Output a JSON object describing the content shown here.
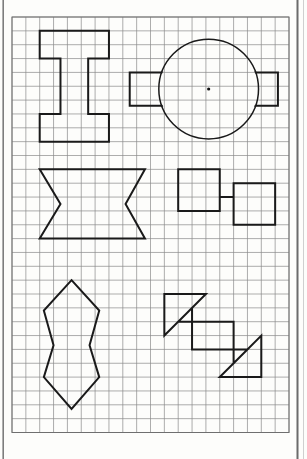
{
  "document": {
    "kind": "graph-paper-worksheet",
    "background_color": "#fdfdfb",
    "page_edge_color": "#6b6b6b",
    "caption": ""
  },
  "grid": {
    "label": "square grid",
    "origin_x": 12,
    "origin_y": 17,
    "cell_size": 13.85,
    "columns": 20,
    "rows": 30,
    "line_color": "#8a8a8a",
    "line_width": 0.7,
    "border_color": "#6f6f6f",
    "border_width": 1.0
  },
  "style": {
    "shape_stroke": "#1a1a1a",
    "shape_stroke_width": 2.0,
    "dot_color": "#111111",
    "dot_radius": 1.6
  },
  "shapes": [
    {
      "id": "i-beam",
      "name": "i-beam-shape",
      "description": "Capital I / I-beam outline, top-left quadrant",
      "type": "polygon",
      "grid_points": [
        [
          2,
          1
        ],
        [
          7,
          1
        ],
        [
          7,
          3
        ],
        [
          5.5,
          3
        ],
        [
          5.5,
          7
        ],
        [
          7,
          7
        ],
        [
          7,
          9
        ],
        [
          2,
          9
        ],
        [
          2,
          7
        ],
        [
          3.5,
          7
        ],
        [
          3.5,
          3
        ],
        [
          2,
          3
        ]
      ]
    },
    {
      "id": "circle-with-tabs",
      "name": "circle-with-tabs-shape",
      "description": "Circle with rectangular tabs extending left and right, dot at centre",
      "type": "composite",
      "circle": {
        "center_grid": [
          14.2,
          5.2
        ],
        "radius_cells": 3.6
      },
      "left_tab_grid": [
        [
          8.5,
          4.0
        ],
        [
          11.2,
          4.0
        ],
        [
          11.2,
          6.4
        ],
        [
          8.5,
          6.4
        ]
      ],
      "right_tab_grid": [
        [
          17.2,
          4.0
        ],
        [
          19.2,
          4.0
        ],
        [
          19.2,
          6.4
        ],
        [
          17.2,
          6.4
        ]
      ],
      "center_dot_grid": [
        14.2,
        5.2
      ]
    },
    {
      "id": "bowtie-wide",
      "name": "wide-bowtie-shape",
      "description": "Wide hourglass / bowtie with concave left and right sides, middle-left",
      "type": "polygon",
      "grid_points": [
        [
          2,
          11
        ],
        [
          9.6,
          11
        ],
        [
          8.2,
          13.5
        ],
        [
          9.6,
          16
        ],
        [
          2,
          16
        ],
        [
          3.5,
          13.5
        ]
      ]
    },
    {
      "id": "double-square-step",
      "name": "double-square-step-shape",
      "description": "Two squares joined corner to corner by a short step, middle-right",
      "type": "polyline-closed",
      "grid_points": [
        [
          12,
          11
        ],
        [
          15,
          11
        ],
        [
          15,
          13
        ],
        [
          16,
          13
        ],
        [
          16,
          12
        ],
        [
          19,
          12
        ],
        [
          19,
          15
        ],
        [
          16,
          15
        ],
        [
          16,
          13
        ],
        [
          15,
          13
        ],
        [
          15,
          14
        ],
        [
          12,
          14
        ]
      ]
    },
    {
      "id": "double-diamond",
      "name": "vertical-double-diamond-shape",
      "description": "Elongated vertical double diamond with pinched waist, bottom-left",
      "type": "polygon",
      "grid_points": [
        [
          4.3,
          19
        ],
        [
          6.3,
          21.2
        ],
        [
          5.6,
          23.7
        ],
        [
          6.3,
          26
        ],
        [
          4.3,
          28.3
        ],
        [
          2.3,
          26
        ],
        [
          3.0,
          23.7
        ],
        [
          2.3,
          21.2
        ]
      ]
    },
    {
      "id": "pinwheel-square",
      "name": "pinwheel-square-shape",
      "description": "Square with right triangles attached at two opposite corners, bottom-right",
      "type": "polygon",
      "grid_points": [
        [
          11,
          20
        ],
        [
          14,
          20
        ],
        [
          12,
          22
        ],
        [
          16,
          22
        ],
        [
          16,
          25
        ],
        [
          18,
          23
        ],
        [
          18,
          26
        ],
        [
          15,
          26
        ],
        [
          17,
          24
        ],
        [
          13,
          24
        ],
        [
          13,
          21
        ],
        [
          11,
          23
        ]
      ]
    }
  ]
}
